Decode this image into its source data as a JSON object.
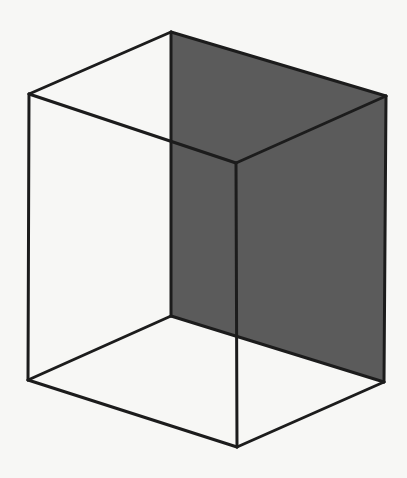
{
  "diagram": {
    "type": "wireframe-cube",
    "colors": {
      "background": "#f7f7f5",
      "edge": "#1c1c1c",
      "shaded_face": "#5b5b5b"
    },
    "vertices": [
      "back-top-left",
      "back-top-right",
      "back-bottom-right",
      "back-bottom-left",
      "front-top-left",
      "front-top-right",
      "front-bottom-right",
      "front-bottom-left"
    ],
    "shaded_face": "back-right-face",
    "edges": [
      [
        "back-top-left",
        "back-top-right"
      ],
      [
        "back-top-right",
        "back-bottom-right"
      ],
      [
        "back-bottom-right",
        "back-bottom-left"
      ],
      [
        "back-bottom-left",
        "back-top-left"
      ],
      [
        "front-top-left",
        "front-top-right"
      ],
      [
        "front-top-right",
        "front-bottom-right"
      ],
      [
        "front-bottom-right",
        "front-bottom-left"
      ],
      [
        "front-bottom-left",
        "front-top-left"
      ],
      [
        "back-top-left",
        "front-top-left"
      ],
      [
        "back-top-right",
        "front-top-right"
      ],
      [
        "back-bottom-right",
        "front-bottom-right"
      ],
      [
        "back-bottom-left",
        "front-bottom-left"
      ]
    ]
  }
}
